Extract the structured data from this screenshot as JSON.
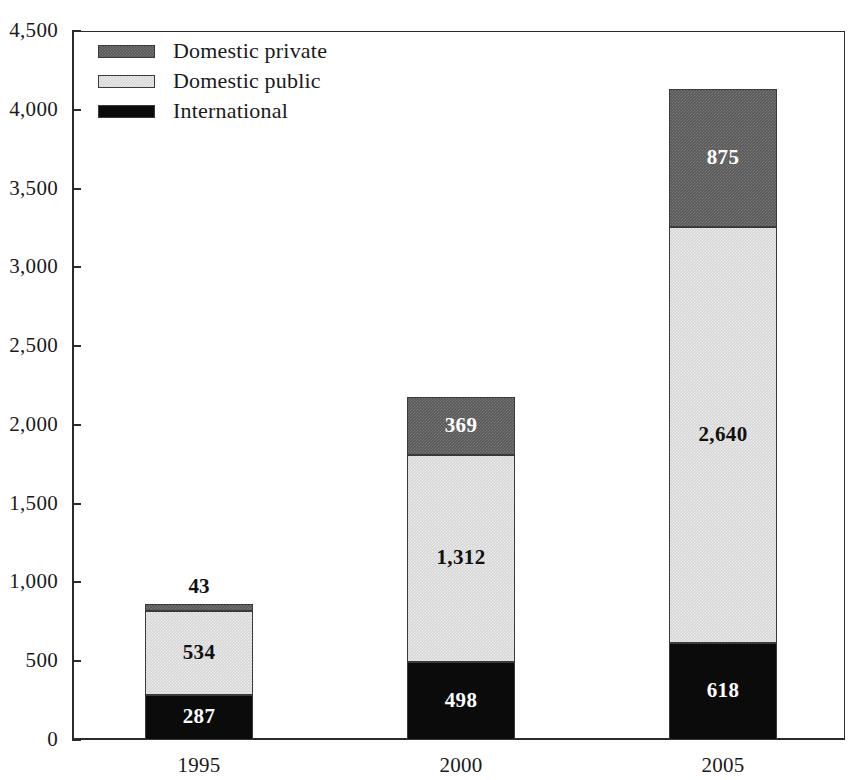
{
  "chart_data": {
    "type": "bar",
    "subtype": "stacked-vertical",
    "title": "",
    "subtitle": "",
    "xlabel": "",
    "ylabel": "",
    "categories": [
      "1995",
      "2000",
      "2005"
    ],
    "ylim": [
      0,
      4500
    ],
    "y_ticks": [
      "0",
      "500",
      "1,000",
      "1,500",
      "2,000",
      "2,500",
      "3,000",
      "3,500",
      "4,000",
      "4,500"
    ],
    "y_tick_values": [
      0,
      500,
      1000,
      1500,
      2000,
      2500,
      3000,
      3500,
      4000,
      4500
    ],
    "grid": false,
    "legend_position": "top-left-inside",
    "series": [
      {
        "name": "International",
        "color": "#0b0b0b",
        "label_color": "#ffffff",
        "values": [
          287,
          498,
          618
        ],
        "labels": [
          "287",
          "498",
          "618"
        ]
      },
      {
        "name": "Domestic public",
        "color": "#d5d5d5",
        "label_color": "#111111",
        "values": [
          534,
          1312,
          2640
        ],
        "labels": [
          "534",
          "1,312",
          "2,640"
        ]
      },
      {
        "name": "Domestic private",
        "color": "#585858",
        "label_color": "#ffffff",
        "values": [
          43,
          369,
          875
        ],
        "labels": [
          "43",
          "369",
          "875"
        ]
      }
    ],
    "totals": [
      864,
      2179,
      4133
    ],
    "stack_order_bottom_to_top": [
      "International",
      "Domestic public",
      "Domestic private"
    ]
  },
  "legend": {
    "items": [
      {
        "label": "Domestic private",
        "swatch": "#585858"
      },
      {
        "label": "Domestic public",
        "swatch": "#d5d5d5"
      },
      {
        "label": "International",
        "swatch": "#0b0b0b"
      }
    ]
  },
  "axis": {
    "y_labels": [
      "4,500",
      "4,000",
      "3,500",
      "3,000",
      "2,500",
      "2,000",
      "1,500",
      "1,000",
      "500",
      "0"
    ],
    "x_labels": [
      "1995",
      "2000",
      "2005"
    ]
  }
}
